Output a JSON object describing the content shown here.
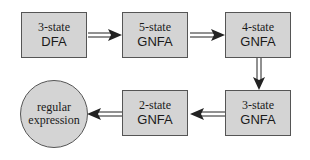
{
  "diagram": {
    "type": "flowchart",
    "nodes": [
      {
        "id": "n1",
        "shape": "rectangle",
        "line1": "3-state",
        "line2": "DFA"
      },
      {
        "id": "n2",
        "shape": "rectangle",
        "line1": "5-state",
        "line2": "GNFA"
      },
      {
        "id": "n3",
        "shape": "rectangle",
        "line1": "4-state",
        "line2": "GNFA"
      },
      {
        "id": "n4",
        "shape": "rectangle",
        "line1": "3-state",
        "line2": "GNFA"
      },
      {
        "id": "n5",
        "shape": "rectangle",
        "line1": "2-state",
        "line2": "GNFA"
      },
      {
        "id": "n6",
        "shape": "circle",
        "line1": "regular",
        "line2": "expression"
      }
    ],
    "edges": [
      {
        "from": "n1",
        "to": "n2",
        "style": "double-line-arrow",
        "direction": "right"
      },
      {
        "from": "n2",
        "to": "n3",
        "style": "double-line-arrow",
        "direction": "right"
      },
      {
        "from": "n3",
        "to": "n4",
        "style": "double-line-arrow",
        "direction": "down"
      },
      {
        "from": "n4",
        "to": "n5",
        "style": "double-line-arrow",
        "direction": "left"
      },
      {
        "from": "n5",
        "to": "n6",
        "style": "double-line-arrow",
        "direction": "left"
      }
    ],
    "colors": {
      "node_fill": "#d4d4d4",
      "node_border": "#555555",
      "arrow": "#222222",
      "text": "#1a1a1a",
      "background": "#ffffff"
    }
  }
}
